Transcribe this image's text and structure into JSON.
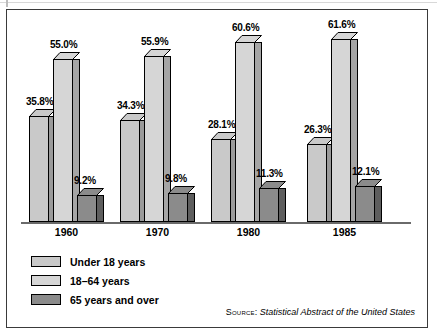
{
  "chart_data": {
    "type": "bar",
    "title": "",
    "subtitle": "",
    "xlabel": "",
    "ylabel": "",
    "categories": [
      "1960",
      "1970",
      "1980",
      "1985"
    ],
    "series": [
      {
        "name": "Under 18 years",
        "values": [
          35.8,
          34.3,
          28.1,
          26.3
        ],
        "labels": [
          "35.8%",
          "34.3%",
          "28.1%",
          "26.3%"
        ],
        "color": "#c9c9c9",
        "side_color": "#9a9a9a"
      },
      {
        "name": "18–64 years",
        "values": [
          55.0,
          55.9,
          60.6,
          61.6
        ],
        "labels": [
          "55.0%",
          "55.9%",
          "60.6%",
          "61.6%"
        ],
        "color": "#d6d6d6",
        "side_color": "#a5a5a5"
      },
      {
        "name": "65 years and over",
        "values": [
          9.2,
          9.8,
          11.3,
          12.1
        ],
        "labels": [
          "9.2%",
          "9.8%",
          "11.3%",
          "12.1%"
        ],
        "color": "#8b8b8b",
        "side_color": "#5e5e5e"
      }
    ],
    "ylim": [
      0,
      65
    ],
    "grid": false,
    "legend_position": "bottom-left",
    "value_labels_shown": true,
    "style": "3d-bars"
  },
  "legend": {
    "items": [
      {
        "label": "Under 18 years",
        "swatch": "#c9c9c9"
      },
      {
        "label": "18–64 years",
        "swatch": "#d6d6d6"
      },
      {
        "label": "65 years and over",
        "swatch": "#8b8b8b"
      }
    ]
  },
  "source": {
    "prefix": "Source:",
    "title": "Statistical Abstract of the United States"
  },
  "axis": {
    "categories": [
      "1960",
      "1970",
      "1980",
      "1985"
    ]
  }
}
